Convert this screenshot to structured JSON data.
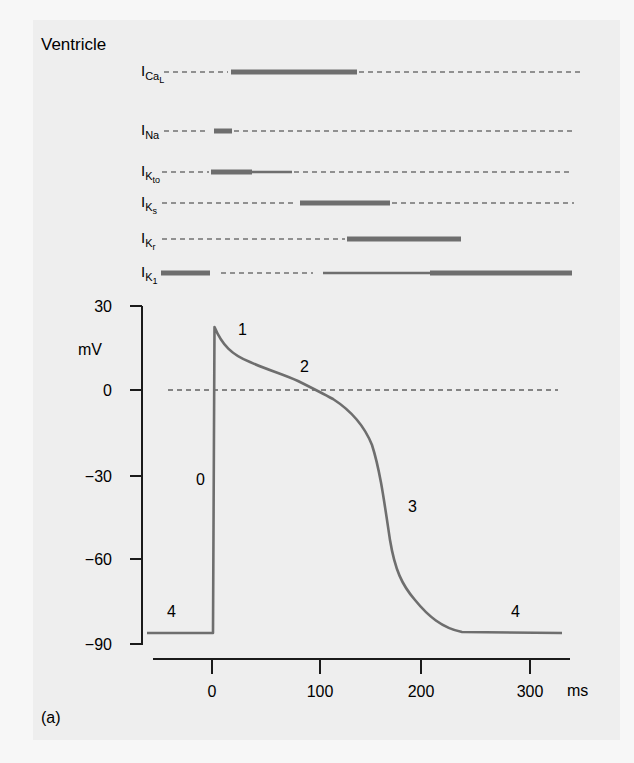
{
  "figure": {
    "title": "Ventricle",
    "panel_label": "(a)",
    "colors": {
      "trace": "#6e6e6e",
      "bar": "#6e6e6e",
      "axis": "#1a1a1a",
      "panel_bg": "#eeeeee",
      "page_bg": "#f7f7f7"
    }
  },
  "currents": [
    {
      "name": "I",
      "sub": "Ca",
      "subsub": "L",
      "y": 72,
      "segments": [
        {
          "type": "dash",
          "x1": 164,
          "x2": 228
        },
        {
          "type": "thick",
          "x1": 231,
          "x2": 357
        },
        {
          "type": "dash",
          "x1": 359,
          "x2": 583
        }
      ]
    },
    {
      "name": "I",
      "sub": "Na",
      "subsub": "",
      "y": 131,
      "segments": [
        {
          "type": "dash",
          "x1": 164,
          "x2": 205
        },
        {
          "type": "thick",
          "x1": 214,
          "x2": 232
        },
        {
          "type": "dash",
          "x1": 234,
          "x2": 573
        }
      ]
    },
    {
      "name": "I",
      "sub": "K",
      "subsub": "to",
      "y": 172,
      "segments": [
        {
          "type": "dash",
          "x1": 162,
          "x2": 209
        },
        {
          "type": "thick",
          "x1": 211,
          "x2": 252
        },
        {
          "type": "thin",
          "x1": 252,
          "x2": 292
        },
        {
          "type": "dash",
          "x1": 294,
          "x2": 572
        }
      ]
    },
    {
      "name": "I",
      "sub": "K",
      "subsub": "s",
      "y": 203,
      "segments": [
        {
          "type": "dash",
          "x1": 162,
          "x2": 297
        },
        {
          "type": "thick",
          "x1": 300,
          "x2": 390
        },
        {
          "type": "dash",
          "x1": 392,
          "x2": 574
        }
      ]
    },
    {
      "name": "I",
      "sub": "K",
      "subsub": "r",
      "y": 239,
      "segments": [
        {
          "type": "dash",
          "x1": 162,
          "x2": 345
        },
        {
          "type": "thick",
          "x1": 347,
          "x2": 461
        }
      ]
    },
    {
      "name": "I",
      "sub": "K",
      "subsub": "1",
      "y": 273,
      "segments": [
        {
          "type": "thick",
          "x1": 161,
          "x2": 210
        },
        {
          "type": "dash",
          "x1": 221,
          "x2": 313
        },
        {
          "type": "thin",
          "x1": 323,
          "x2": 430
        },
        {
          "type": "thick",
          "x1": 430,
          "x2": 572
        }
      ]
    }
  ],
  "chart_data": {
    "type": "line",
    "title": "Ventricle",
    "xlabel": "ms",
    "ylabel": "mV",
    "xlim": [
      -55,
      330
    ],
    "ylim": [
      -90,
      30
    ],
    "x_ticks": [
      0,
      100,
      200,
      300
    ],
    "y_ticks": [
      30,
      0,
      -30,
      -60,
      -90
    ],
    "reference_line": {
      "y": 0,
      "style": "dashed"
    },
    "series": [
      {
        "name": "Ventricular action potential",
        "x": [
          -60,
          0,
          1,
          2,
          10,
          20,
          40,
          60,
          80,
          95,
          110,
          130,
          150,
          160,
          165,
          170,
          175,
          180,
          190,
          200,
          215,
          230,
          250,
          300,
          330
        ],
        "y": [
          -86,
          -86,
          -86,
          22,
          16,
          12,
          8,
          5,
          2,
          0,
          -3,
          -8,
          -17,
          -28,
          -40,
          -55,
          -66,
          -70,
          -76,
          -80,
          -84,
          -86,
          -86,
          -86,
          -86
        ]
      }
    ],
    "phase_annotations": [
      {
        "label": "0",
        "x": -12,
        "y": -30
      },
      {
        "label": "1",
        "x": 25,
        "y": 19
      },
      {
        "label": "2",
        "x": 85,
        "y": 7
      },
      {
        "label": "3",
        "x": 188,
        "y": -40
      },
      {
        "label": "4",
        "x": -40,
        "y": -80
      },
      {
        "label": "4",
        "x": 290,
        "y": -80
      }
    ]
  },
  "axes": {
    "y_label": "mV",
    "x_unit": "ms",
    "y_ticks": [
      {
        "label": "30",
        "py": 306
      },
      {
        "label": "0",
        "py": 390
      },
      {
        "label": "−30",
        "py": 476
      },
      {
        "label": "−60",
        "py": 559
      },
      {
        "label": "−90",
        "py": 644
      }
    ],
    "x_ticks": [
      {
        "label": "0",
        "px": 212
      },
      {
        "label": "100",
        "px": 320
      },
      {
        "label": "200",
        "px": 421
      },
      {
        "label": "300",
        "px": 530
      }
    ]
  },
  "phases": {
    "p0": "0",
    "p1": "1",
    "p2": "2",
    "p3": "3",
    "p4a": "4",
    "p4b": "4"
  }
}
